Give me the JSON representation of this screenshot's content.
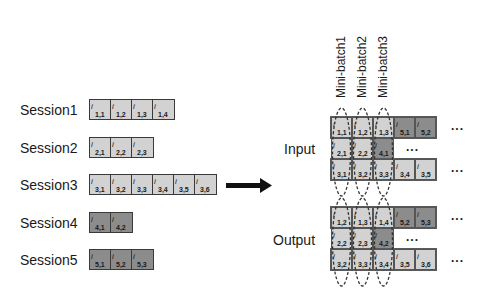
{
  "sessions": [
    {
      "label": "Session1",
      "tone": "light",
      "items": [
        "1,1",
        "1,2",
        "1,3",
        "1,4"
      ]
    },
    {
      "label": "Session2",
      "tone": "light",
      "items": [
        "2,1",
        "2,2",
        "2,3"
      ]
    },
    {
      "label": "Session3",
      "tone": "light",
      "items": [
        "3,1",
        "3,2",
        "3,3",
        "3,4",
        "3,5",
        "3,6"
      ]
    },
    {
      "label": "Session4",
      "tone": "dark",
      "items": [
        "4,1",
        "4,2"
      ]
    },
    {
      "label": "Session5",
      "tone": "dark",
      "items": [
        "5,1",
        "5,2",
        "5,3"
      ]
    }
  ],
  "minibatches": [
    "Mini-batch1",
    "Mini-batch2",
    "Mini-batch3"
  ],
  "input": {
    "label": "Input",
    "rows": [
      {
        "cells": [
          {
            "v": "1,1",
            "t": "light"
          },
          {
            "v": "1,2",
            "t": "light"
          },
          {
            "v": "1,3",
            "t": "light"
          },
          {
            "v": "5,1",
            "t": "dark"
          },
          {
            "v": "5,2",
            "t": "dark"
          }
        ],
        "trail": "..."
      },
      {
        "cells": [
          {
            "v": "2,1",
            "t": "light"
          },
          {
            "v": "2,2",
            "t": "light"
          },
          {
            "v": "4,1",
            "t": "dark"
          }
        ],
        "trail": "..."
      },
      {
        "cells": [
          {
            "v": "3,1",
            "t": "light"
          },
          {
            "v": "3,2",
            "t": "light"
          },
          {
            "v": "3,3",
            "t": "light"
          },
          {
            "v": "3,4",
            "t": "light"
          },
          {
            "v": "3,5",
            "t": "light"
          }
        ],
        "trail": "..."
      }
    ]
  },
  "output": {
    "label": "Output",
    "rows": [
      {
        "cells": [
          {
            "v": "1,2",
            "t": "light"
          },
          {
            "v": "1,3",
            "t": "light"
          },
          {
            "v": "1,4",
            "t": "light"
          },
          {
            "v": "5,2",
            "t": "dark"
          },
          {
            "v": "5,3",
            "t": "dark"
          }
        ],
        "trail": "..."
      },
      {
        "cells": [
          {
            "v": "2,2",
            "t": "light"
          },
          {
            "v": "2,3",
            "t": "light"
          },
          {
            "v": "4,2",
            "t": "dark"
          }
        ],
        "trail": "..."
      },
      {
        "cells": [
          {
            "v": "3,2",
            "t": "light"
          },
          {
            "v": "3,3",
            "t": "light"
          },
          {
            "v": "3,4",
            "t": "light"
          },
          {
            "v": "3,5",
            "t": "light"
          },
          {
            "v": "3,6",
            "t": "light"
          }
        ],
        "trail": "..."
      }
    ]
  },
  "item_symbol": "i",
  "colors": {
    "light": "#d2d2d2",
    "dark": "#8c8c8c",
    "border": "#3a3a3a"
  }
}
